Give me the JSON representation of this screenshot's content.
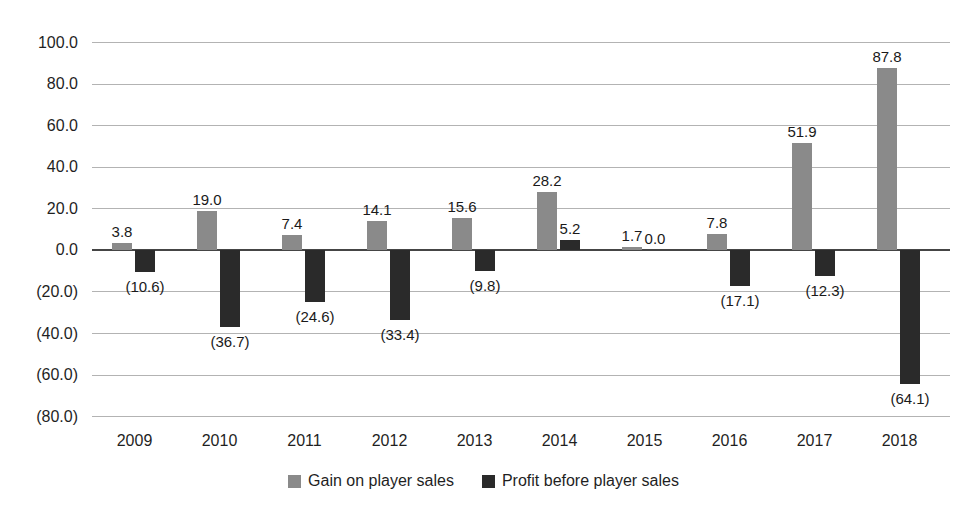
{
  "chart_data": {
    "type": "bar",
    "title": "",
    "categories": [
      "2009",
      "2010",
      "2011",
      "2012",
      "2013",
      "2014",
      "2015",
      "2016",
      "2017",
      "2018"
    ],
    "series": [
      {
        "name": "Gain on player sales",
        "color": "#8a8a8a",
        "values": [
          3.8,
          19.0,
          7.4,
          14.1,
          15.6,
          28.2,
          1.7,
          7.8,
          51.9,
          87.8
        ],
        "labels": [
          "3.8",
          "19.0",
          "7.4",
          "14.1",
          "15.6",
          "28.2",
          "1.7",
          "7.8",
          "51.9",
          "87.8"
        ]
      },
      {
        "name": "Profit before player sales",
        "color": "#2a2a2a",
        "values": [
          -10.6,
          -36.7,
          -24.6,
          -33.4,
          -9.8,
          5.2,
          0.0,
          -17.1,
          -12.3,
          -64.1
        ],
        "labels": [
          "(10.6)",
          "(36.7)",
          "(24.6)",
          "(33.4)",
          "(9.8)",
          "5.2",
          "0.0",
          "(17.1)",
          "(12.3)",
          "(64.1)"
        ]
      }
    ],
    "y_tick_values": [
      100,
      80,
      60,
      40,
      20,
      0,
      -20,
      -40,
      -60,
      -80
    ],
    "y_tick_labels": [
      "100.0",
      "80.0",
      "60.0",
      "40.0",
      "20.0",
      "0.0",
      "(20.0)",
      "(40.0)",
      "(60.0)",
      "(80.0)"
    ],
    "ylim": [
      -80,
      100
    ],
    "grid": true,
    "legend_position": "bottom",
    "negative_format": "parentheses"
  },
  "colors": {
    "background": "#ffffff",
    "gridline": "#b3b3b3",
    "axis_line": "#454545",
    "text": "#1f1f1f"
  }
}
